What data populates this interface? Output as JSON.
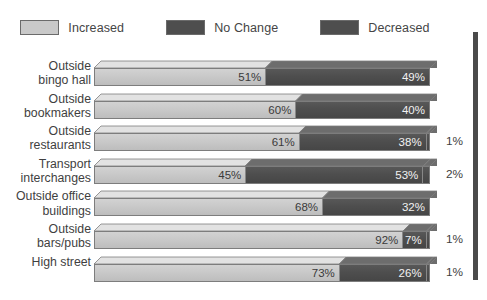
{
  "legend": {
    "items": [
      {
        "label": "Increased",
        "color": "#c9c9c9",
        "key": "increased"
      },
      {
        "label": "No Change",
        "color": "#4e4e4e",
        "key": "no_change"
      },
      {
        "label": "Decreased",
        "color": "#4e4e4e",
        "key": "decreased"
      }
    ]
  },
  "chart_data": {
    "type": "bar",
    "orientation": "horizontal",
    "stacked": true,
    "stacked_mode": "percent",
    "title": "",
    "xlabel": "",
    "ylabel": "",
    "xlim": [
      0,
      100
    ],
    "grid": false,
    "legend_position": "top",
    "categories": [
      "Outside bingo hall",
      "Outside bookmakers",
      "Outside restaurants",
      "Transport interchanges",
      "Outside office buildings",
      "Outside bars/pubs",
      "High street"
    ],
    "series": [
      {
        "name": "Increased",
        "values": [
          51,
          60,
          61,
          45,
          68,
          92,
          73
        ]
      },
      {
        "name": "No Change",
        "values": [
          49,
          40,
          38,
          53,
          32,
          7,
          26
        ]
      },
      {
        "name": "Decreased",
        "values": [
          0,
          0,
          1,
          2,
          0,
          1,
          1
        ]
      }
    ]
  },
  "rows": [
    {
      "label_line1": "Outside",
      "label_line2": "bingo hall",
      "segments": [
        {
          "key": "increased",
          "value": 51,
          "label": "51%",
          "inside": true
        },
        {
          "key": "no_change",
          "value": 49,
          "label": "49%",
          "inside": true
        }
      ],
      "outside_label": ""
    },
    {
      "label_line1": "Outside",
      "label_line2": "bookmakers",
      "segments": [
        {
          "key": "increased",
          "value": 60,
          "label": "60%",
          "inside": true
        },
        {
          "key": "no_change",
          "value": 40,
          "label": "40%",
          "inside": true
        }
      ],
      "outside_label": ""
    },
    {
      "label_line1": "Outside",
      "label_line2": "restaurants",
      "segments": [
        {
          "key": "increased",
          "value": 61,
          "label": "61%",
          "inside": true
        },
        {
          "key": "no_change",
          "value": 38,
          "label": "38%",
          "inside": true
        },
        {
          "key": "decreased",
          "value": 1,
          "label": "",
          "inside": true
        }
      ],
      "outside_label": "1%"
    },
    {
      "label_line1": "Transport",
      "label_line2": "interchanges",
      "segments": [
        {
          "key": "increased",
          "value": 45,
          "label": "45%",
          "inside": true
        },
        {
          "key": "no_change",
          "value": 53,
          "label": "53%",
          "inside": true
        },
        {
          "key": "decreased",
          "value": 2,
          "label": "",
          "inside": true
        }
      ],
      "outside_label": "2%"
    },
    {
      "label_line1": "Outside office",
      "label_line2": "buildings",
      "segments": [
        {
          "key": "increased",
          "value": 68,
          "label": "68%",
          "inside": true
        },
        {
          "key": "no_change",
          "value": 32,
          "label": "32%",
          "inside": true
        }
      ],
      "outside_label": ""
    },
    {
      "label_line1": "Outside",
      "label_line2": "bars/pubs",
      "segments": [
        {
          "key": "increased",
          "value": 92,
          "label": "92%",
          "inside": true
        },
        {
          "key": "no_change",
          "value": 7,
          "label": "7%",
          "inside": true
        },
        {
          "key": "decreased",
          "value": 1,
          "label": "",
          "inside": true
        }
      ],
      "outside_label": "1%"
    },
    {
      "label_line1": "High street",
      "label_line2": "",
      "segments": [
        {
          "key": "increased",
          "value": 73,
          "label": "73%",
          "inside": true
        },
        {
          "key": "no_change",
          "value": 26,
          "label": "26%",
          "inside": true
        },
        {
          "key": "decreased",
          "value": 1,
          "label": "",
          "inside": true
        }
      ],
      "outside_label": "1%"
    }
  ]
}
